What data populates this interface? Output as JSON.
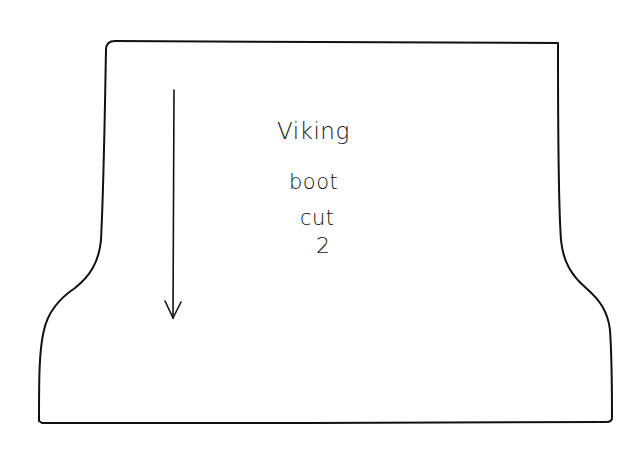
{
  "pattern_piece": {
    "name": "Viking boot",
    "label_lines": [
      "Viking",
      "boot",
      "cut",
      "2"
    ],
    "grainline_arrow": {
      "direction": "down",
      "x": 174,
      "y_start": 90,
      "y_end": 318
    },
    "stroke_color": "#111111",
    "background_color": "#ffffff"
  }
}
